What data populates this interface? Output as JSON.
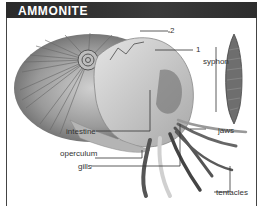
{
  "title": "AMMONITE",
  "labels": {
    "label_2": "2",
    "label_1": "1",
    "syphon": "syphon",
    "intestine": "intestine",
    "operculum": "operculum",
    "gills": "gills",
    "jaws": "jaws",
    "tentacles": "tentacles"
  },
  "colors": {
    "title_bg": "#2e2e2e",
    "title_text": "#ffffff",
    "shell": "#8a8a8a",
    "leader_lines": "#333333"
  }
}
